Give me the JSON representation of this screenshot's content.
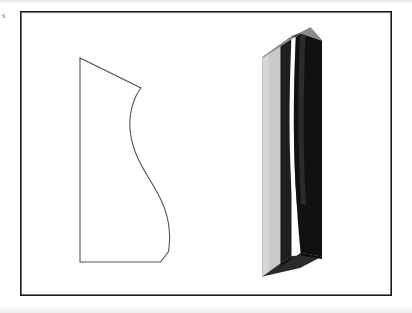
{
  "figure": {
    "caption_mark": "s",
    "border": {
      "color": "#1a1a1a",
      "x": 20,
      "y": 11,
      "width": 372,
      "height": 285,
      "stroke_width": 1.6
    },
    "background_color": "#ffffff",
    "panels": [
      {
        "id": "profile-outline",
        "label": "2D profile outline",
        "stroke_color": "#555555",
        "fill": "none",
        "stroke_width": 1.1,
        "vertices": {
          "top_left": [
            80,
            58
          ],
          "peak_right": [
            141,
            88
          ],
          "bottom_left": [
            78,
            262
          ],
          "bottom_right": [
            160,
            262
          ]
        },
        "path": "M 80 58 L 80 262 L 160 262 L 168 252 C 171 225 163 198 148 176 C 133 154 126 128 133 104 C 135 98 138 93 141 88 Z"
      },
      {
        "id": "extruded-solid",
        "label": "3D extruded solid",
        "faces": [
          {
            "name": "top-face",
            "color": "#8a8a8a"
          },
          {
            "name": "left-face",
            "color": "#c9c9c9"
          },
          {
            "name": "inner-dark-face",
            "color": "#1e1e1e"
          },
          {
            "name": "right-face",
            "color": "#111111"
          },
          {
            "name": "highlight-strip",
            "color": "#fdfdfd"
          },
          {
            "name": "bottom-face",
            "color": "#2a2a2a"
          }
        ],
        "bounds": {
          "x": 258,
          "y": 25,
          "width": 66,
          "height": 255
        }
      }
    ]
  }
}
